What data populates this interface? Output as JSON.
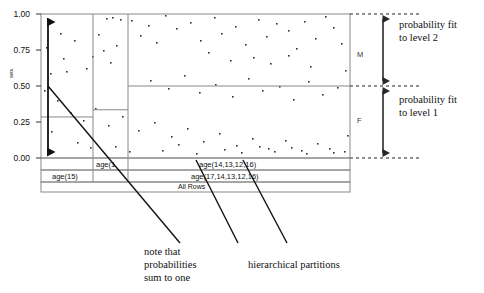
{
  "figure": {
    "type": "partition-scatter-diagram",
    "y_axis": {
      "label": "sex",
      "ticks": [
        "1.00",
        "0.75",
        "0.50",
        "0.25",
        "0.00"
      ],
      "tick_values": [
        1.0,
        0.75,
        0.5,
        0.25,
        0.0
      ],
      "range": [
        0,
        1
      ]
    },
    "category_labels": {
      "upper": "M",
      "lower": "F"
    }
  },
  "annotations": {
    "level2": "probability fit\nto level 2",
    "level2_line1": "probability fit",
    "level2_line2": "to level 2",
    "level1_line1": "probability fit",
    "level1_line2": "to level 1",
    "note_line1": "note that",
    "note_line2": "probabilities",
    "note_line3": "sum to one",
    "partitions_caption": "hierarchical partitions"
  },
  "partition_rows": {
    "level2": [
      {
        "label": "age(1",
        "x": 93,
        "width": 35
      },
      {
        "label": "age(14,13,12,16)",
        "x": 128,
        "width": 222
      }
    ],
    "level1": [
      {
        "label": "age(15)",
        "x": 41,
        "width": 87
      },
      {
        "label": "age(17,14,13,12,16)",
        "x": 128,
        "width": 222
      }
    ],
    "root": {
      "label": "All Rows"
    }
  },
  "chart_data": {
    "type": "scatter",
    "title": "",
    "xlabel": "",
    "ylabel": "sex",
    "ylim": [
      0,
      1
    ],
    "grid": false,
    "legend": "none",
    "probability_steps": [
      {
        "partition": "age(15)",
        "x0": 41,
        "x1": 93,
        "p": 0.285
      },
      {
        "partition": "age(1",
        "x0": 93,
        "x1": 128,
        "p": 0.335
      },
      {
        "partition": "age(14,13,12,16)",
        "x0": 128,
        "x1": 350,
        "p": 0.5
      }
    ],
    "points": [
      [
        60,
        33
      ],
      [
        74,
        40
      ],
      [
        46,
        47
      ],
      [
        63,
        58
      ],
      [
        86,
        68
      ],
      [
        92,
        56
      ],
      [
        66,
        71
      ],
      [
        50,
        73
      ],
      [
        98,
        34
      ],
      [
        106,
        18
      ],
      [
        112,
        17
      ],
      [
        120,
        19
      ],
      [
        103,
        50
      ],
      [
        116,
        45
      ],
      [
        110,
        62
      ],
      [
        131,
        20
      ],
      [
        148,
        25
      ],
      [
        140,
        35
      ],
      [
        156,
        42
      ],
      [
        165,
        15
      ],
      [
        176,
        28
      ],
      [
        190,
        22
      ],
      [
        200,
        40
      ],
      [
        214,
        17
      ],
      [
        221,
        33
      ],
      [
        235,
        26
      ],
      [
        245,
        44
      ],
      [
        258,
        19
      ],
      [
        266,
        36
      ],
      [
        276,
        23
      ],
      [
        288,
        30
      ],
      [
        296,
        48
      ],
      [
        304,
        21
      ],
      [
        315,
        38
      ],
      [
        325,
        16
      ],
      [
        333,
        27
      ],
      [
        341,
        43
      ],
      [
        208,
        52
      ],
      [
        230,
        60
      ],
      [
        253,
        57
      ],
      [
        270,
        63
      ],
      [
        288,
        55
      ],
      [
        310,
        66
      ],
      [
        150,
        80
      ],
      [
        168,
        88
      ],
      [
        184,
        75
      ],
      [
        199,
        92
      ],
      [
        215,
        84
      ],
      [
        232,
        96
      ],
      [
        248,
        78
      ],
      [
        262,
        90
      ],
      [
        279,
        86
      ],
      [
        293,
        99
      ],
      [
        308,
        81
      ],
      [
        322,
        94
      ],
      [
        337,
        87
      ],
      [
        345,
        70
      ],
      [
        57,
        100
      ],
      [
        70,
        112
      ],
      [
        83,
        120
      ],
      [
        95,
        108
      ],
      [
        108,
        125
      ],
      [
        122,
        116
      ],
      [
        138,
        130
      ],
      [
        154,
        122
      ],
      [
        171,
        136
      ],
      [
        187,
        128
      ],
      [
        203,
        141
      ],
      [
        219,
        133
      ],
      [
        236,
        145
      ],
      [
        252,
        138
      ],
      [
        268,
        148
      ],
      [
        285,
        140
      ],
      [
        301,
        150
      ],
      [
        317,
        143
      ],
      [
        333,
        152
      ],
      [
        347,
        135
      ],
      [
        44,
        90
      ],
      [
        51,
        131
      ],
      [
        77,
        142
      ],
      [
        90,
        147
      ],
      [
        115,
        146
      ],
      [
        129,
        151
      ],
      [
        162,
        150
      ],
      [
        178,
        144
      ],
      [
        196,
        153
      ],
      [
        224,
        149
      ],
      [
        241,
        152
      ],
      [
        259,
        146
      ],
      [
        274,
        151
      ],
      [
        291,
        147
      ],
      [
        306,
        153
      ],
      [
        329,
        148
      ],
      [
        344,
        151
      ]
    ]
  }
}
